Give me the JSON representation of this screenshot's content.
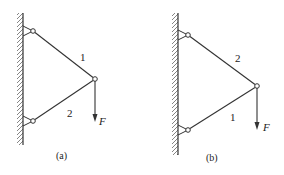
{
  "figures": [
    {
      "id": "a",
      "caption": "(a)",
      "wall": {
        "x": 23,
        "y1": 13,
        "y2": 145
      },
      "top_pin": {
        "x": 33,
        "y": 31
      },
      "bottom_pin": {
        "x": 33,
        "y": 121
      },
      "joint": {
        "x": 95,
        "y": 79
      },
      "arrow_end": {
        "x": 95,
        "y": 122
      },
      "labels": {
        "upper_bar": "1",
        "lower_bar": "2",
        "force": "F"
      }
    },
    {
      "id": "b",
      "caption": "(b)",
      "wall": {
        "x": 178,
        "y1": 13,
        "y2": 155
      },
      "top_pin": {
        "x": 188,
        "y": 35
      },
      "bottom_pin": {
        "x": 188,
        "y": 130
      },
      "joint": {
        "x": 257,
        "y": 86
      },
      "arrow_end": {
        "x": 257,
        "y": 130
      },
      "labels": {
        "upper_bar": "2",
        "lower_bar": "1",
        "force": "F"
      }
    }
  ],
  "colors": {
    "stroke": "#333333",
    "hatch": "#666666",
    "background": "#ffffff"
  }
}
